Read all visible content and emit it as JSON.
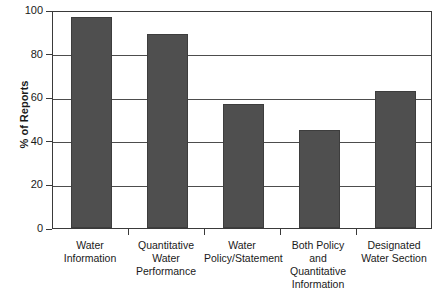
{
  "chart_data": {
    "type": "bar",
    "title": "",
    "subtitle": "",
    "xlabel": "",
    "ylabel": "% of Reports",
    "ylim": [
      0,
      100
    ],
    "ytick_values": [
      0,
      20,
      40,
      60,
      80,
      100
    ],
    "ytick_labels": [
      "0",
      "20",
      "40",
      "60",
      "80",
      "100"
    ],
    "grid": true,
    "legend": false,
    "legend_position": "none",
    "categories": [
      "Water Information",
      "Quantitative Water Performance",
      "Water Policy/Statement",
      "Both Policy and Quantitative Information",
      "Designated Water Section"
    ],
    "category_lines": [
      [
        "Water",
        "Information"
      ],
      [
        "Quantitative",
        "Water",
        "Performance"
      ],
      [
        "Water",
        "Policy/Statement"
      ],
      [
        "Both Policy",
        "and",
        "Quantitative",
        "Information"
      ],
      [
        "Designated",
        "Water Section"
      ]
    ],
    "values": [
      97,
      89,
      57,
      45,
      63
    ],
    "bar_color": "#4f4f4f",
    "bar_edge_color": "#3d3d3d",
    "axis_color": "#3a3a3a",
    "grid_color": "#4d4d4d",
    "background_color": "#ffffff"
  }
}
